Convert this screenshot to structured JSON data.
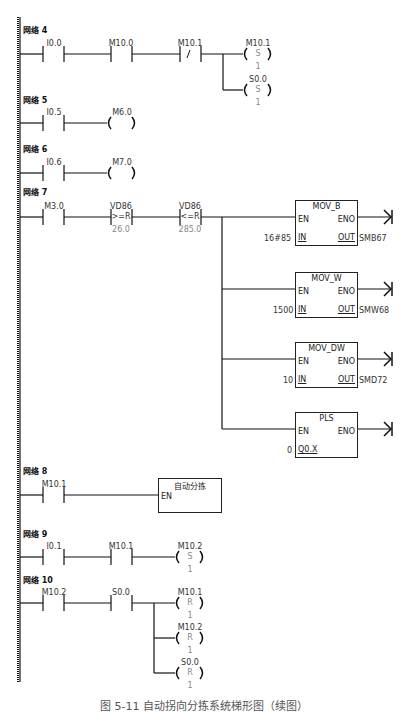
{
  "networks": [
    {
      "id": "4",
      "title": "网络 4",
      "contacts": [
        {
          "addr": "I0.0",
          "type": "NO"
        },
        {
          "addr": "M10.0",
          "type": "NO"
        },
        {
          "addr": "M10.1",
          "type": "NC",
          "symbol": "/"
        }
      ],
      "coils": [
        {
          "addr": "M10.1",
          "op": "S",
          "n": "1"
        },
        {
          "addr": "S0.0",
          "op": "S",
          "n": "1"
        }
      ]
    },
    {
      "id": "5",
      "title": "网络 5",
      "contacts": [
        {
          "addr": "I0.5",
          "type": "NO"
        }
      ],
      "coils": [
        {
          "addr": "M6.0",
          "op": ""
        }
      ]
    },
    {
      "id": "6",
      "title": "网络 6",
      "contacts": [
        {
          "addr": "I0.6",
          "type": "NO"
        }
      ],
      "coils": [
        {
          "addr": "M7.0",
          "op": ""
        }
      ]
    },
    {
      "id": "7",
      "title": "网络 7",
      "contacts": [
        {
          "addr": "M3.0",
          "type": "NO"
        },
        {
          "addr": "VD86",
          "type": "CMP",
          "symbol": ">=R",
          "value": "26.0"
        },
        {
          "addr": "VD86",
          "type": "CMP",
          "symbol": "<=R",
          "value": "285.0"
        }
      ],
      "boxes": [
        {
          "name": "MOV_B",
          "en": "EN",
          "eno": "ENO",
          "in_label": "IN",
          "in_value": "16#85",
          "out_label": "OUT",
          "out_value": "SMB67"
        },
        {
          "name": "MOV_W",
          "en": "EN",
          "eno": "ENO",
          "in_label": "IN",
          "in_value": "1500",
          "out_label": "OUT",
          "out_value": "SMW68"
        },
        {
          "name": "MOV_DW",
          "en": "EN",
          "eno": "ENO",
          "in_label": "IN",
          "in_value": "10",
          "out_label": "OUT",
          "out_value": "SMD72"
        },
        {
          "name": "PLS",
          "en": "EN",
          "eno": "ENO",
          "in_label": "Q0.X",
          "in_value": "0"
        }
      ]
    },
    {
      "id": "8",
      "title": "网络 8",
      "contacts": [
        {
          "addr": "M10.1",
          "type": "NO"
        }
      ],
      "boxes": [
        {
          "name": "自动分拣",
          "en": "EN"
        }
      ]
    },
    {
      "id": "9",
      "title": "网络 9",
      "contacts": [
        {
          "addr": "I0.1",
          "type": "NO"
        },
        {
          "addr": "M10.1",
          "type": "NO"
        }
      ],
      "coils": [
        {
          "addr": "M10.2",
          "op": "S",
          "n": "1"
        }
      ]
    },
    {
      "id": "10",
      "title": "网络 10",
      "contacts": [
        {
          "addr": "M10.2",
          "type": "NO"
        },
        {
          "addr": "S0.0",
          "type": "NO"
        }
      ],
      "coils": [
        {
          "addr": "M10.1",
          "op": "R",
          "n": "1"
        },
        {
          "addr": "M10.2",
          "op": "R",
          "n": "1"
        },
        {
          "addr": "S0.0",
          "op": "R",
          "n": "1"
        }
      ]
    }
  ],
  "caption": "图 5-11  自动拐向分拣系统梯形图（续图）"
}
